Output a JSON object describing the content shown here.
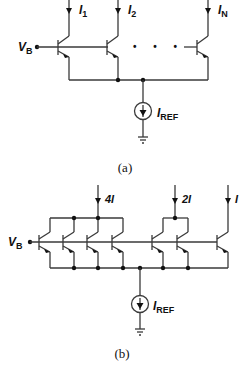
{
  "figure_a": {
    "caption": "(a)",
    "base_voltage": {
      "main": "V",
      "sub": "B"
    },
    "output_currents": [
      {
        "main": "I",
        "sub": "1"
      },
      {
        "main": "I",
        "sub": "2"
      },
      {
        "main": "I",
        "sub": "N"
      }
    ],
    "ellipsis": "• • •",
    "reference_current": {
      "main": "I",
      "sub": "REF"
    }
  },
  "figure_b": {
    "caption": "(b)",
    "base_voltage": {
      "main": "V",
      "sub": "B"
    },
    "output_currents": [
      "4I",
      "2I",
      "I"
    ],
    "reference_current": {
      "main": "I",
      "sub": "REF"
    },
    "transistor_groups": [
      {
        "label": "4I",
        "count": 4
      },
      {
        "label": "2I",
        "count": 2
      },
      {
        "label": "I",
        "count": 1
      }
    ]
  },
  "colors": {
    "wire": "#3a3a3a",
    "text": "#111111",
    "background": "#ffffff"
  }
}
